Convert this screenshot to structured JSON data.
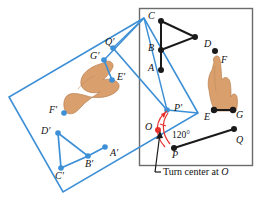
{
  "figure": {
    "title_caption": "Turn center at ",
    "caption_symbol": "O",
    "angle_label": "120°",
    "colors": {
      "blue": "#3d8fd6",
      "blue_dark": "#2e7cc4",
      "black": "#1a1a1a",
      "red": "#e8302a",
      "hand_fill": "#d9a06e",
      "hand_edge": "#b9804f",
      "frame_gray": "#6b6b6b",
      "background": "#ffffff"
    },
    "original_plane": {
      "name": "black-frame-plane",
      "rect": {
        "x": 139,
        "y": 8,
        "w": 114,
        "h": 158
      }
    },
    "turned_plane": {
      "name": "blue-parallelogram-plane",
      "points": "144,18 9,97 63,192 198,113"
    },
    "labels_original": [
      {
        "id": "C",
        "text": "C",
        "x": 149,
        "y": 11,
        "point_x": 161,
        "point_y": 21
      },
      {
        "id": "B",
        "text": "B",
        "x": 149,
        "y": 43,
        "point_x": 161,
        "point_y": 50
      },
      {
        "id": "A",
        "text": "A",
        "x": 149,
        "y": 64,
        "point_x": 161,
        "point_y": 70
      },
      {
        "id": "D",
        "text": "D",
        "x": 205,
        "y": 40,
        "point_x": 215,
        "point_y": 51
      },
      {
        "id": "F",
        "text": "F",
        "x": 222,
        "y": 57,
        "point_x": null,
        "point_y": null
      },
      {
        "id": "E",
        "text": "E",
        "x": 205,
        "y": 113,
        "point_x": 214,
        "point_y": 110
      },
      {
        "id": "G",
        "text": "G",
        "x": 236,
        "y": 112,
        "point_x": 233,
        "point_y": 110
      },
      {
        "id": "Q",
        "text": "Q",
        "x": 236,
        "y": 137,
        "point_x": 234,
        "point_y": 129
      },
      {
        "id": "P",
        "text": "P",
        "x": 177,
        "y": 155,
        "point_x": 174,
        "point_y": 148
      },
      {
        "id": "O",
        "text": "O",
        "x": 146,
        "y": 123,
        "point_x": 158,
        "point_y": 130
      }
    ],
    "labels_turned": [
      {
        "id": "Qp",
        "text": "Q′",
        "x": 106,
        "y": 38,
        "point_x": 113,
        "point_y": 48
      },
      {
        "id": "Gp",
        "text": "G′",
        "x": 92,
        "y": 52,
        "point_x": 104,
        "point_y": 60
      },
      {
        "id": "Ep",
        "text": "E′",
        "x": 118,
        "y": 73,
        "point_x": 112,
        "point_y": 80
      },
      {
        "id": "Fp",
        "text": "F′",
        "x": 50,
        "y": 107,
        "point_x": 64,
        "point_y": 113
      },
      {
        "id": "Dp",
        "text": "D′",
        "x": 42,
        "y": 127,
        "point_x": 58,
        "point_y": 133
      },
      {
        "id": "Cp",
        "text": "C′",
        "x": 56,
        "y": 173,
        "point_x": 61,
        "point_y": 168
      },
      {
        "id": "Bp",
        "text": "B′",
        "x": 86,
        "y": 161,
        "point_x": 88,
        "point_y": 156
      },
      {
        "id": "Ap",
        "text": "A′",
        "x": 110,
        "y": 150,
        "point_x": 105,
        "point_y": 147
      },
      {
        "id": "Pp",
        "text": "P′",
        "x": 175,
        "y": 104,
        "point_x": 167,
        "point_y": 110
      }
    ],
    "triangle_original": {
      "name": "triangle-CBA-D",
      "vertices": "161,21 195,37 161,50"
    },
    "segment_AB": {
      "x1": 161,
      "y1": 50,
      "x2": 161,
      "y2": 70
    },
    "segment_EG": {
      "x1": 214,
      "y1": 110,
      "x2": 233,
      "y2": 110
    },
    "segment_PQ": {
      "x1": 174,
      "y1": 148,
      "x2": 234,
      "y2": 129
    },
    "triangle_turned": {
      "name": "triangle-DpCpBp",
      "vertices": "58,133 88,156 61,168"
    },
    "segment_ApBp": {
      "x1": 88,
      "y1": 156,
      "x2": 105,
      "y2": 147
    },
    "segment_GpEp": {
      "x1": 104,
      "y1": 60,
      "x2": 112,
      "y2": 80
    },
    "segment_QpPp": {
      "x1": 113,
      "y1": 48,
      "x2": 167,
      "y2": 110
    },
    "arc_rotation": "M 168,112 C 160,122 158,134 170,144",
    "arc_rotation2": "M 166,108 C 155,118 153,133 164,146",
    "leader_line": {
      "x1": 157,
      "y1": 171,
      "x2": 160,
      "y2": 131
    },
    "caption_rule": {
      "x1": 148,
      "y1": 166,
      "x2": 253,
      "y2": 166
    }
  }
}
